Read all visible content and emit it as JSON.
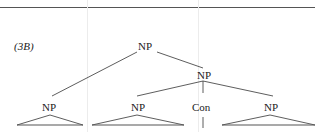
{
  "example": {
    "label_open": "(",
    "label_num": "3B",
    "label_close": ")",
    "full_label": "(3B)"
  },
  "tree": {
    "root": "NP",
    "left_child": "NP",
    "right_child": "NP",
    "conjunct_1": "NP",
    "conjunction": "Con",
    "conjunct_2": "NP"
  },
  "colors": {
    "ink": "#222222",
    "rule": "#555555"
  }
}
